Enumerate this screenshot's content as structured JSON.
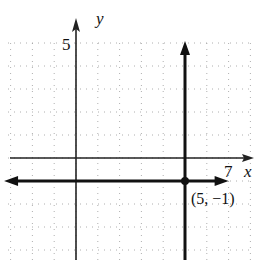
{
  "chart_data": {
    "type": "line",
    "title": "",
    "xlabel": "x",
    "ylabel": "y",
    "xlim": [
      -3,
      8
    ],
    "ylim": [
      -4,
      5
    ],
    "grid": true,
    "grid_style": "dotted",
    "x_tick_labels": [
      {
        "value": 7,
        "label": "7"
      }
    ],
    "y_tick_labels": [
      {
        "value": 5,
        "label": "5"
      }
    ],
    "series": [
      {
        "name": "horizontal line y = -1",
        "kind": "horizontal",
        "y": -1,
        "x_range": [
          -3.3,
          7
        ],
        "arrow": "both"
      },
      {
        "name": "vertical line x = 5",
        "kind": "vertical",
        "x": 5,
        "y_range": [
          -4.5,
          5
        ],
        "arrow": "up"
      }
    ],
    "points": [
      {
        "x": 5,
        "y": -1,
        "label": "(5, −1)"
      }
    ],
    "colors": {
      "axis": "#222222",
      "line": "#111111",
      "grid": "#9a9a9a"
    }
  }
}
